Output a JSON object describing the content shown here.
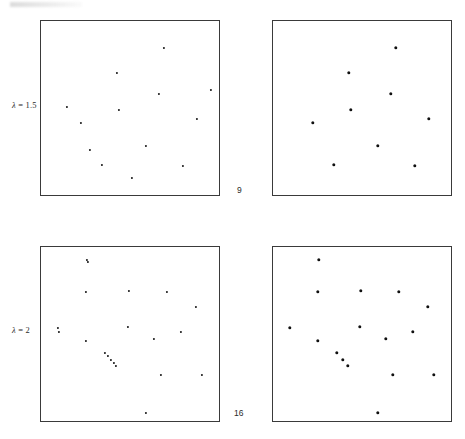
{
  "figure": {
    "title": "",
    "background_color": "#ffffff",
    "point_color": "#111111",
    "frame_color": "#3a3a3a",
    "width": 465,
    "height": 439
  },
  "row_labels": [
    {
      "name": "lambda-1-5",
      "symbol": "λ",
      "equals": " = ",
      "value": "1.5",
      "x": 12,
      "y": 100
    },
    {
      "name": "lambda-2",
      "symbol": "λ",
      "equals": " = ",
      "value": "2",
      "x": 12,
      "y": 325
    }
  ],
  "count_labels": [
    {
      "name": "count-9",
      "text": "9",
      "x": 237,
      "y": 185
    },
    {
      "name": "count-16",
      "text": "16",
      "x": 234,
      "y": 408
    }
  ],
  "chart_data": {
    "type": "scatter",
    "xlabel": "",
    "ylabel": "",
    "xlim": [
      0,
      1
    ],
    "ylim": [
      0,
      1
    ],
    "grid": false,
    "legend": null,
    "annotations": [
      {
        "text": "λ = 1.5",
        "role": "row-label",
        "row": 0
      },
      {
        "text": "λ = 2",
        "role": "row-label",
        "row": 1
      },
      {
        "text": "9",
        "role": "point-count",
        "panel": "top"
      },
      {
        "text": "16",
        "role": "point-count",
        "panel": "bottom"
      }
    ],
    "panels": [
      {
        "id": "panel-top-left",
        "name": "scatter-panel-lambda1p5-left",
        "row_label": "λ = 1.5",
        "n_points": 13,
        "marker_size": 2.2,
        "frame": {
          "x": 40,
          "y": 20,
          "width": 180,
          "height": 176
        },
        "points": [
          {
            "x": 0.683,
            "y": 0.846
          },
          {
            "x": 0.422,
            "y": 0.705
          },
          {
            "x": 0.656,
            "y": 0.585
          },
          {
            "x": 0.433,
            "y": 0.494
          },
          {
            "x": 0.867,
            "y": 0.443
          },
          {
            "x": 0.222,
            "y": 0.42
          },
          {
            "x": 0.583,
            "y": 0.29
          },
          {
            "x": 0.339,
            "y": 0.182
          },
          {
            "x": 0.789,
            "y": 0.176
          },
          {
            "x": 0.272,
            "y": 0.267
          },
          {
            "x": 0.144,
            "y": 0.511
          },
          {
            "x": 0.944,
            "y": 0.608
          },
          {
            "x": 0.506,
            "y": 0.108
          }
        ]
      },
      {
        "id": "panel-top-right",
        "name": "scatter-panel-lambda1p5-right",
        "row_label": "λ = 1.5",
        "n_points": 9,
        "marker_size": 3.4,
        "frame": {
          "x": 272,
          "y": 20,
          "width": 180,
          "height": 176
        },
        "points": [
          {
            "x": 0.683,
            "y": 0.846
          },
          {
            "x": 0.422,
            "y": 0.705
          },
          {
            "x": 0.656,
            "y": 0.585
          },
          {
            "x": 0.433,
            "y": 0.494
          },
          {
            "x": 0.867,
            "y": 0.443
          },
          {
            "x": 0.222,
            "y": 0.42
          },
          {
            "x": 0.583,
            "y": 0.29
          },
          {
            "x": 0.339,
            "y": 0.182
          },
          {
            "x": 0.789,
            "y": 0.176
          }
        ]
      },
      {
        "id": "panel-bottom-left",
        "name": "scatter-panel-lambda2-left",
        "row_label": "λ = 2",
        "n_points": 20,
        "marker_size": 2.2,
        "frame": {
          "x": 40,
          "y": 246,
          "width": 180,
          "height": 176
        },
        "points": [
          {
            "x": 0.256,
            "y": 0.926
          },
          {
            "x": 0.489,
            "y": 0.75
          },
          {
            "x": 0.7,
            "y": 0.744
          },
          {
            "x": 0.25,
            "y": 0.744
          },
          {
            "x": 0.861,
            "y": 0.659
          },
          {
            "x": 0.094,
            "y": 0.54
          },
          {
            "x": 0.483,
            "y": 0.545
          },
          {
            "x": 0.778,
            "y": 0.517
          },
          {
            "x": 0.25,
            "y": 0.466
          },
          {
            "x": 0.628,
            "y": 0.477
          },
          {
            "x": 0.356,
            "y": 0.398
          },
          {
            "x": 0.389,
            "y": 0.358
          },
          {
            "x": 0.417,
            "y": 0.324
          },
          {
            "x": 0.667,
            "y": 0.273
          },
          {
            "x": 0.894,
            "y": 0.273
          },
          {
            "x": 0.583,
            "y": 0.057
          },
          {
            "x": 0.372,
            "y": 0.381
          },
          {
            "x": 0.406,
            "y": 0.341
          },
          {
            "x": 0.101,
            "y": 0.519
          },
          {
            "x": 0.262,
            "y": 0.915
          }
        ]
      },
      {
        "id": "panel-bottom-right",
        "name": "scatter-panel-lambda2-right",
        "row_label": "λ = 2",
        "n_points": 16,
        "marker_size": 3.4,
        "frame": {
          "x": 272,
          "y": 246,
          "width": 180,
          "height": 176
        },
        "points": [
          {
            "x": 0.256,
            "y": 0.926
          },
          {
            "x": 0.489,
            "y": 0.75
          },
          {
            "x": 0.7,
            "y": 0.744
          },
          {
            "x": 0.25,
            "y": 0.744
          },
          {
            "x": 0.861,
            "y": 0.659
          },
          {
            "x": 0.094,
            "y": 0.54
          },
          {
            "x": 0.483,
            "y": 0.545
          },
          {
            "x": 0.778,
            "y": 0.517
          },
          {
            "x": 0.25,
            "y": 0.466
          },
          {
            "x": 0.628,
            "y": 0.477
          },
          {
            "x": 0.356,
            "y": 0.398
          },
          {
            "x": 0.389,
            "y": 0.358
          },
          {
            "x": 0.417,
            "y": 0.324
          },
          {
            "x": 0.667,
            "y": 0.273
          },
          {
            "x": 0.894,
            "y": 0.273
          },
          {
            "x": 0.583,
            "y": 0.057
          }
        ]
      }
    ]
  }
}
